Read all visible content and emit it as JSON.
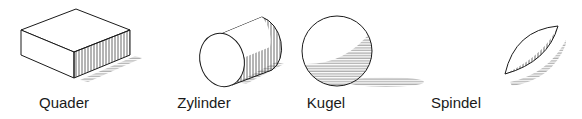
{
  "figure": {
    "shapes": [
      {
        "id": "quader",
        "label": "Quader",
        "center_x": 64
      },
      {
        "id": "zylinder",
        "label": "Zylinder",
        "center_x": 204
      },
      {
        "id": "kugel",
        "label": "Kugel",
        "center_x": 326
      },
      {
        "id": "spindel",
        "label": "Spindel",
        "center_x": 456
      }
    ],
    "colors": {
      "stroke": "#1a1a1a",
      "hatch": "#444444",
      "shadow": "#9a9a9a"
    }
  }
}
